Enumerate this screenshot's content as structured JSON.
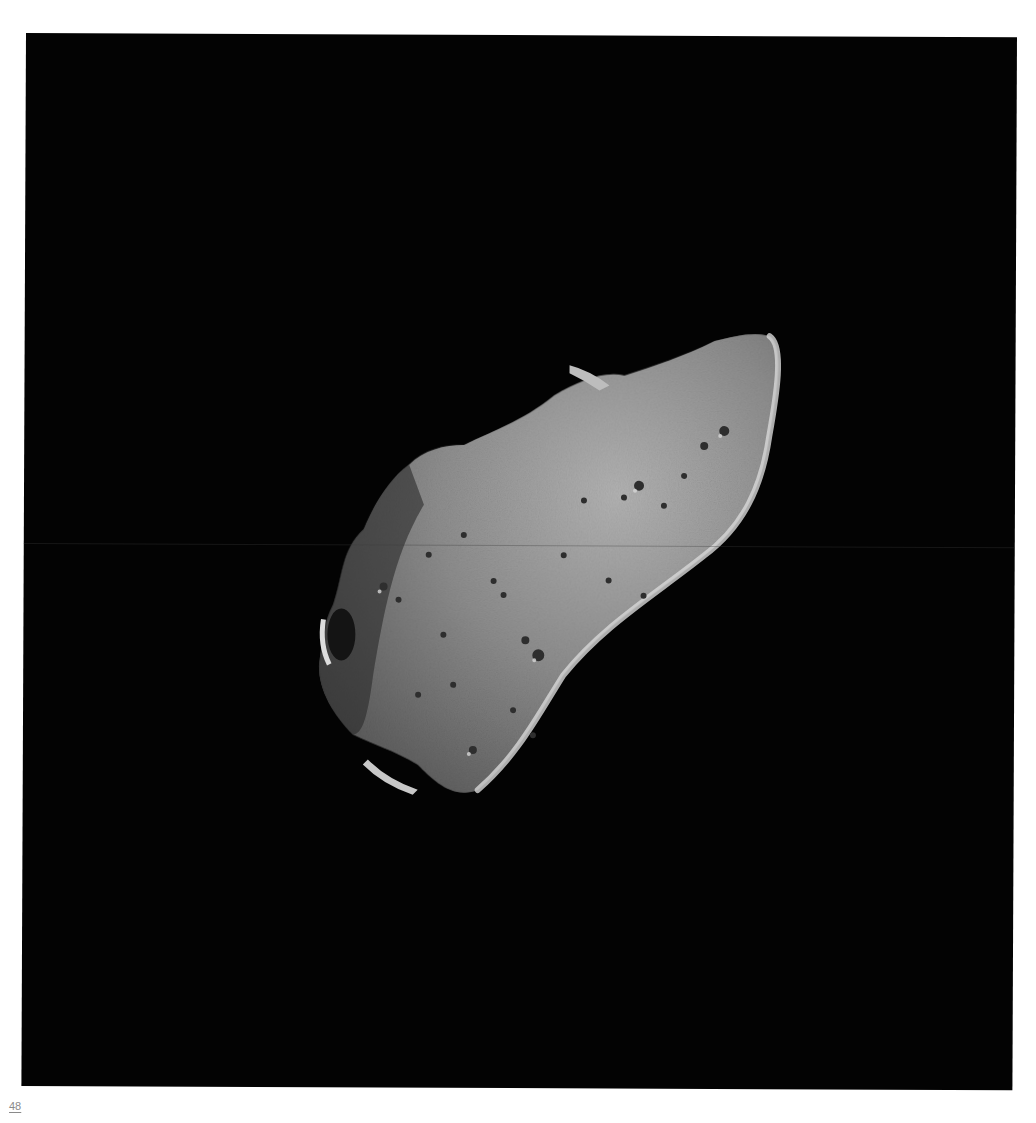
{
  "page": {
    "number": "48",
    "photo_subject": "asteroid",
    "background_color": "#030303",
    "surface_color": "#8e8e8e"
  }
}
